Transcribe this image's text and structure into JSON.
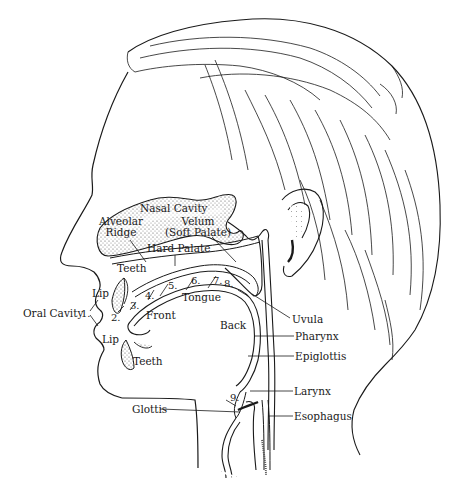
{
  "figure": {
    "stroke_color": "#1a1a1a",
    "shade_color": "#8a8a8a",
    "background": "#ffffff"
  },
  "labels": {
    "nasal_cavity": "Nasal Cavity",
    "velum_line1": "Velum",
    "velum_line2": "(Soft Palate)",
    "alveolar_line1": "Alveolar",
    "alveolar_line2": "Ridge",
    "hard_palate": "Hard Palate",
    "teeth_upper": "Teeth",
    "lip_upper": "Lip",
    "oral_cavity": "Oral Cavity",
    "lip_lower": "Lip",
    "teeth_lower": "Teeth",
    "front": "Front",
    "tongue": "Tongue",
    "back": "Back",
    "uvula": "Uvula",
    "pharynx": "Pharynx",
    "epiglottis": "Epiglottis",
    "larynx": "Larynx",
    "esophagus": "Esophagus",
    "glottis": "Glottis"
  },
  "places_of_articulation": [
    {
      "n": "1.",
      "place": "Bilabial (lips)"
    },
    {
      "n": "2.",
      "place": "Labiodental"
    },
    {
      "n": "3.",
      "place": "Dental"
    },
    {
      "n": "4.",
      "place": "Alveolar"
    },
    {
      "n": "5.",
      "place": "Postalveolar / Palato-alveolar"
    },
    {
      "n": "6.",
      "place": "Palatal"
    },
    {
      "n": "7.",
      "place": "Velar"
    },
    {
      "n": "8.",
      "place": "Uvular"
    },
    {
      "n": "9.",
      "place": "Glottal"
    }
  ]
}
